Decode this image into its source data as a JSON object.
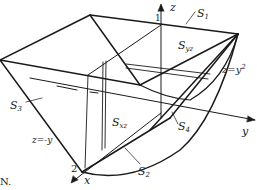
{
  "figure": {
    "colors": {
      "stroke": "#1a1a1a",
      "background": "#ffffff"
    },
    "axes": {
      "x": "x",
      "y": "y",
      "z": "z"
    },
    "tick_labels": {
      "z_one": "1",
      "x_two": "2"
    },
    "surfaces": {
      "S1": {
        "base": "S",
        "sub": "1"
      },
      "S2": {
        "base": "S",
        "sub": "2"
      },
      "S3": {
        "base": "S",
        "sub": "3"
      },
      "S4": {
        "base": "S",
        "sub": "4"
      },
      "Syz": {
        "base": "S",
        "sub": "yz"
      },
      "Sxz": {
        "base": "S",
        "sub": "xz"
      }
    },
    "equations": {
      "parabola": {
        "lhs": "z=y",
        "sup": "2"
      },
      "line": "z=-y"
    },
    "corner_text": "N."
  }
}
